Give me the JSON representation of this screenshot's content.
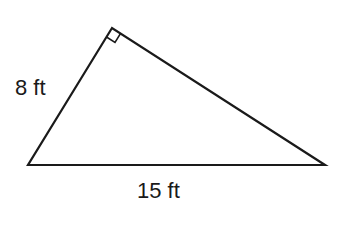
{
  "figure": {
    "type": "right-triangle",
    "vertices": {
      "right_angle": [
        112,
        28
      ],
      "bottom_left": [
        28,
        165
      ],
      "bottom_right": [
        325,
        165
      ]
    },
    "stroke_color": "#1a1a1a",
    "labels": {
      "leg": "8 ft",
      "base": "15 ft"
    },
    "right_angle_marker": true
  }
}
